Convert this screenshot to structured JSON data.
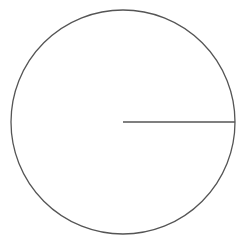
{
  "diagram": {
    "type": "circle-with-radius",
    "stroke_color": "#555555",
    "background": "#ffffff",
    "circle": {
      "cx": 123,
      "cy": 122,
      "r": 112
    },
    "radius_line": {
      "x1": 123,
      "y1": 122,
      "x2": 235,
      "y2": 122
    }
  }
}
